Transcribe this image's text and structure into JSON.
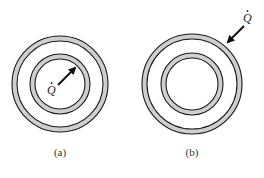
{
  "figures": [
    {
      "id": "a",
      "caption": "(a)",
      "heat_label": "Q̇",
      "heat_direction": "outward from center, pointing to inner shell",
      "center": [
        60,
        84
      ],
      "outer_shell": {
        "r_out": 48,
        "r_in": 43
      },
      "inner_shell": {
        "r_out": 30,
        "r_in": 25
      }
    },
    {
      "id": "b",
      "caption": "(b)",
      "heat_label": "Q̇",
      "heat_direction": "inward from outside, pointing to outer shell",
      "center": [
        192,
        84
      ],
      "outer_shell": {
        "r_out": 50,
        "r_in": 45
      },
      "inner_shell": {
        "r_out": 31,
        "r_in": 26
      }
    }
  ],
  "colors": {
    "stroke": "#1a1a1a",
    "shell_fill": "#cfcfcf",
    "background": "#ffffff"
  }
}
